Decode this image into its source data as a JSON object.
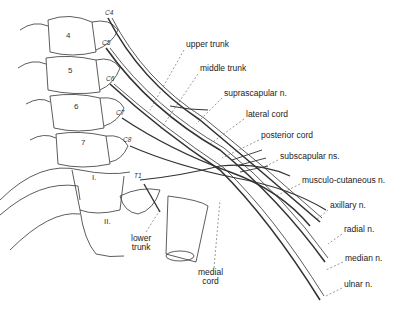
{
  "diagram": {
    "vertebrae": [
      {
        "id": "v4",
        "label": "4",
        "x": 66,
        "y": 36
      },
      {
        "id": "v5",
        "label": "5",
        "x": 68,
        "y": 71
      },
      {
        "id": "v6",
        "label": "6",
        "x": 74,
        "y": 107
      },
      {
        "id": "v7",
        "label": "7",
        "x": 81,
        "y": 143
      },
      {
        "id": "rib1",
        "label": "I.",
        "x": 92,
        "y": 178
      },
      {
        "id": "rib2",
        "label": "II.",
        "x": 104,
        "y": 222
      }
    ],
    "roots": [
      {
        "id": "c4",
        "label": "C4",
        "x": 107,
        "y": 13
      },
      {
        "id": "c5",
        "label": "C5",
        "x": 104,
        "y": 43
      },
      {
        "id": "c6",
        "label": "C6",
        "x": 108,
        "y": 79
      },
      {
        "id": "c7",
        "label": "C7",
        "x": 118,
        "y": 113
      },
      {
        "id": "c8",
        "label": "C8",
        "x": 125,
        "y": 140
      },
      {
        "id": "t1",
        "label": "T1",
        "x": 136,
        "y": 176
      }
    ],
    "labels": [
      {
        "id": "upper-trunk",
        "text": "upper trunk",
        "x": 186,
        "y": 44
      },
      {
        "id": "middle-trunk",
        "text": "middle trunk",
        "x": 200,
        "y": 68
      },
      {
        "id": "suprascapular-n",
        "text": "suprascapular n.",
        "x": 224,
        "y": 93
      },
      {
        "id": "lateral-cord",
        "text": "lateral cord",
        "x": 246,
        "y": 114
      },
      {
        "id": "posterior-cord",
        "text": "posterior cord",
        "x": 261,
        "y": 135
      },
      {
        "id": "subscapular-ns",
        "text": "subscapular ns.",
        "x": 280,
        "y": 156
      },
      {
        "id": "musculo-cutaneous-n",
        "text": "musculo-cutaneous n.",
        "x": 302,
        "y": 180
      },
      {
        "id": "axillary-n",
        "text": "axillary n.",
        "x": 330,
        "y": 205
      },
      {
        "id": "radial-n",
        "text": "radial n.",
        "x": 344,
        "y": 229
      },
      {
        "id": "median-n",
        "text": "median n.",
        "x": 345,
        "y": 258
      },
      {
        "id": "ulnar-n",
        "text": "ulnar n.",
        "x": 344,
        "y": 284
      },
      {
        "id": "lower-trunk",
        "text": "lower\ntrunk",
        "x": 131,
        "y": 234
      },
      {
        "id": "medial-cord",
        "text": "medial\ncord",
        "x": 198,
        "y": 270
      }
    ]
  }
}
